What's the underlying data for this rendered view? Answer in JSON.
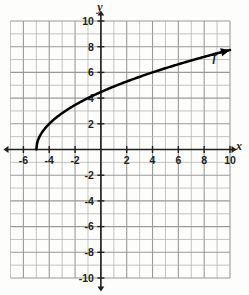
{
  "chart_data": {
    "type": "line",
    "title": "",
    "xlabel": "x",
    "ylabel": "y",
    "xlim": [
      -7,
      10
    ],
    "ylim": [
      -10,
      10
    ],
    "grid": true,
    "grid_step": 1,
    "legend": "none",
    "x_tick_labels": [
      "-6",
      "-4",
      "-2",
      "2",
      "4",
      "6",
      "8",
      "10"
    ],
    "x_tick_values": [
      -6,
      -4,
      -2,
      2,
      4,
      6,
      8,
      10
    ],
    "y_tick_labels": [
      "10",
      "8",
      "6",
      "4",
      "2",
      "-2",
      "-4",
      "-6",
      "-8",
      "-10"
    ],
    "y_tick_values": [
      10,
      8,
      6,
      4,
      2,
      -2,
      -4,
      -6,
      -8,
      -10
    ],
    "series": [
      {
        "name": "f",
        "equation": "f(x) = 2*sqrt(x + 5)",
        "domain_start": -5,
        "domain_end": 10,
        "arrow_end": true,
        "x": [
          -5,
          -4.75,
          -4.5,
          -4,
          -3.5,
          -3,
          -2,
          -1,
          0,
          1,
          2,
          3,
          4,
          5,
          6,
          7,
          8,
          9,
          10
        ],
        "y": [
          0,
          1,
          1.41,
          2,
          2.45,
          2.83,
          3.46,
          4,
          4.47,
          4.9,
          5.29,
          5.66,
          6,
          6.32,
          6.63,
          6.93,
          7.21,
          7.48,
          7.75
        ]
      }
    ],
    "annotations": [
      {
        "text": "f",
        "x": 8.8,
        "y": 6.9
      }
    ],
    "colors": {
      "curve": "#000000",
      "axis": "#231f20",
      "grid": "#b5b5b5",
      "background": "#fdfdfc"
    }
  }
}
